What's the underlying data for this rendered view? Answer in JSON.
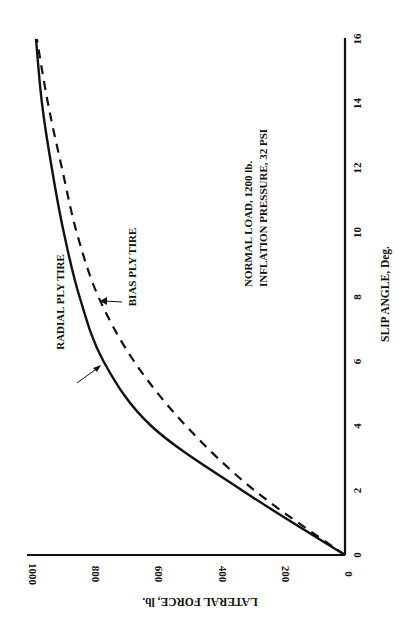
{
  "chart_data": {
    "type": "line",
    "orientation": "rotated-90-ccw",
    "title": "",
    "xlabel": "SLIP ANGLE, Deg.",
    "ylabel": "LATERAL FORCE, lb.",
    "xlim": [
      0,
      16
    ],
    "ylim": [
      0,
      1000
    ],
    "x_ticks": [
      "0",
      "2",
      "4",
      "6",
      "8",
      "10",
      "12",
      "14",
      "16"
    ],
    "y_ticks": [
      "0",
      "200",
      "400",
      "600",
      "800",
      "1000"
    ],
    "grid": false,
    "x": [
      0,
      2,
      4,
      6,
      8,
      10,
      12,
      14,
      16
    ],
    "series": [
      {
        "name": "RADIAL PLY TIRE",
        "style": "solid",
        "values": [
          0,
          325,
          613,
          764,
          840,
          890,
          928,
          959,
          978
        ]
      },
      {
        "name": "BIAS PLY TIRE",
        "style": "dashed",
        "values": [
          0,
          286,
          503,
          667,
          780,
          849,
          896,
          940,
          975
        ]
      }
    ],
    "annotations": [
      "NORMAL LOAD, 1200 lb.",
      "INFLATION PRESSURE, 32 PSI"
    ]
  },
  "labels": {
    "xlabel": "SLIP ANGLE, Deg.",
    "ylabel": "LATERAL FORCE, lb.",
    "radial": "RADIAL PLY TIRE",
    "bias": "BIAS PLY TIRE",
    "note1": "NORMAL LOAD, 1200 lb.",
    "note2": "INFLATION PRESSURE, 32 PSI",
    "x_ticks": [
      "0",
      "2",
      "4",
      "6",
      "8",
      "10",
      "12",
      "14",
      "16"
    ],
    "y_ticks": [
      "0",
      "200",
      "400",
      "600",
      "800",
      "1000"
    ]
  },
  "colors": {
    "ink": "#111111",
    "background": "#ffffff"
  }
}
